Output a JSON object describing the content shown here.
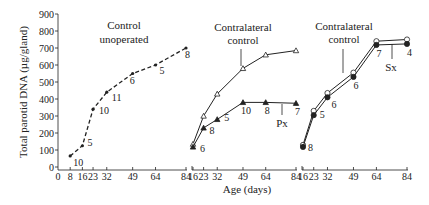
{
  "chart_data": {
    "type": "line",
    "title": "",
    "xlabel": "Age (days)",
    "ylabel": "Total parotid DNA (µg/gland)",
    "ylim": [
      0,
      900
    ],
    "yticks": [
      0,
      100,
      200,
      300,
      400,
      500,
      600,
      700,
      800,
      900
    ],
    "grid": false,
    "legend": "none (inline annotations)",
    "panels": [
      {
        "id": "control-unoperated",
        "label_lines": [
          "Control",
          "unoperated"
        ],
        "xticks": [
          0,
          8,
          16,
          23,
          32,
          49,
          64,
          84
        ],
        "xtick_labels": [
          "0",
          "8",
          "16",
          "23",
          "32",
          "49",
          "64",
          "84"
        ],
        "series": [
          {
            "name": "Control unoperated",
            "marker": "small-dot",
            "line": "dashed",
            "x": [
              8,
              16,
              23,
              32,
              49,
              64,
              84
            ],
            "y": [
              65,
              125,
              340,
              440,
              550,
              600,
              700
            ],
            "n": [
              "10",
              "5",
              "10",
              "11",
              "6",
              "5",
              "8"
            ]
          }
        ]
      },
      {
        "id": "parotidectomy",
        "label_lines": [
          "Contralateral",
          "control"
        ],
        "marker_annotation": "Px",
        "xticks": [
          16,
          23,
          32,
          49,
          64,
          84
        ],
        "xtick_labels": [
          "16",
          "23",
          "32",
          "49",
          "64",
          "84"
        ],
        "series": [
          {
            "name": "Contralateral control",
            "marker": "open-triangle",
            "line": "solid",
            "x": [
              16,
              23,
              32,
              49,
              64,
              84
            ],
            "y": [
              135,
              300,
              430,
              580,
              660,
              685
            ],
            "n": []
          },
          {
            "name": "Px",
            "marker": "filled-triangle",
            "line": "solid",
            "x": [
              16,
              23,
              32,
              49,
              64,
              84
            ],
            "y": [
              118,
              230,
              280,
              380,
              380,
              375
            ],
            "n": [
              "6",
              "8",
              "5",
              "10",
              "8",
              "7"
            ]
          }
        ]
      },
      {
        "id": "sialectomy",
        "label_lines": [
          "Contralateral",
          "control"
        ],
        "marker_annotation": "Sx",
        "xticks": [
          16,
          23,
          32,
          49,
          64,
          84
        ],
        "xtick_labels": [
          "16",
          "23",
          "32",
          "49",
          "64",
          "84"
        ],
        "series": [
          {
            "name": "Contralateral control",
            "marker": "open-circle",
            "line": "solid",
            "x": [
              16,
              23,
              32,
              49,
              64,
              84
            ],
            "y": [
              130,
              330,
              435,
              555,
              740,
              750
            ],
            "n": []
          },
          {
            "name": "Sx",
            "marker": "filled-circle",
            "line": "solid",
            "x": [
              16,
              23,
              32,
              49,
              64,
              84
            ],
            "y": [
              118,
              305,
              410,
              530,
              718,
              724
            ],
            "n": [
              "8",
              "5",
              "6",
              "6",
              "7",
              "4"
            ]
          }
        ]
      }
    ]
  },
  "layout": {
    "y0_px": 167,
    "y900_px": 14,
    "panels_px": [
      {
        "x_start_day": 0,
        "x_end_day": 84,
        "px_start": 58,
        "px_end": 186,
        "axis_from": 58,
        "axis_to": 187,
        "label_x": 124,
        "label_y": [
          29,
          43
        ],
        "n_offsets": [
          [
            3,
            10
          ],
          [
            5,
            0
          ],
          [
            6,
            5
          ],
          [
            5,
            9
          ],
          [
            -3,
            10
          ],
          [
            4,
            9
          ],
          [
            -1,
            10
          ]
        ]
      },
      {
        "x_start_day": 16,
        "x_end_day": 84,
        "px_start": 193,
        "px_end": 296,
        "axis_from": 192,
        "axis_to": 297,
        "label_x": 243,
        "label_y": [
          31,
          44
        ],
        "leader": [
          241,
          49,
          241,
          66
        ],
        "anno_line": [
          282,
          104,
          282,
          115
        ],
        "anno_text": [
          282,
          127
        ],
        "n_offsets": [
          [
            7,
            5
          ],
          [
            6,
            6
          ],
          [
            7,
            2
          ],
          [
            -2,
            12
          ],
          [
            -1,
            12
          ],
          [
            -1,
            12
          ]
        ]
      },
      {
        "x_start_day": 16,
        "x_end_day": 84,
        "px_start": 303,
        "px_end": 407,
        "axis_from": 302,
        "axis_to": 408,
        "label_x": 344,
        "label_y": [
          30,
          43
        ],
        "leader": [
          343,
          49,
          343,
          73
        ],
        "anno_line": [
          392,
          44,
          392,
          59
        ],
        "anno_text": [
          391,
          71
        ],
        "n_offsets": [
          [
            5,
            4
          ],
          [
            6,
            3
          ],
          [
            4,
            11
          ],
          [
            0,
            12
          ],
          [
            0,
            12
          ],
          [
            0,
            12
          ]
        ]
      }
    ],
    "colors": {
      "ink": "#222222",
      "background": "#ffffff"
    }
  }
}
